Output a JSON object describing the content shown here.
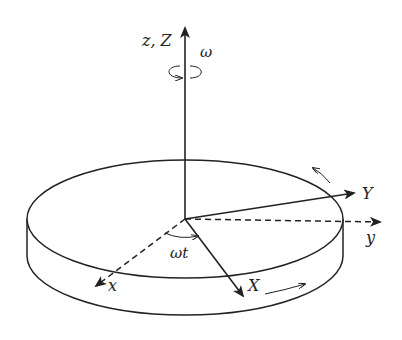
{
  "diagram": {
    "labels": {
      "z_axis": "z, Z",
      "omega": "ω",
      "Y_axis": "Y",
      "y_axis": "y",
      "x_axis": "x",
      "X_axis": "X",
      "angle": "ωt"
    },
    "colors": {
      "stroke": "#222222",
      "background": "#ffffff"
    }
  }
}
